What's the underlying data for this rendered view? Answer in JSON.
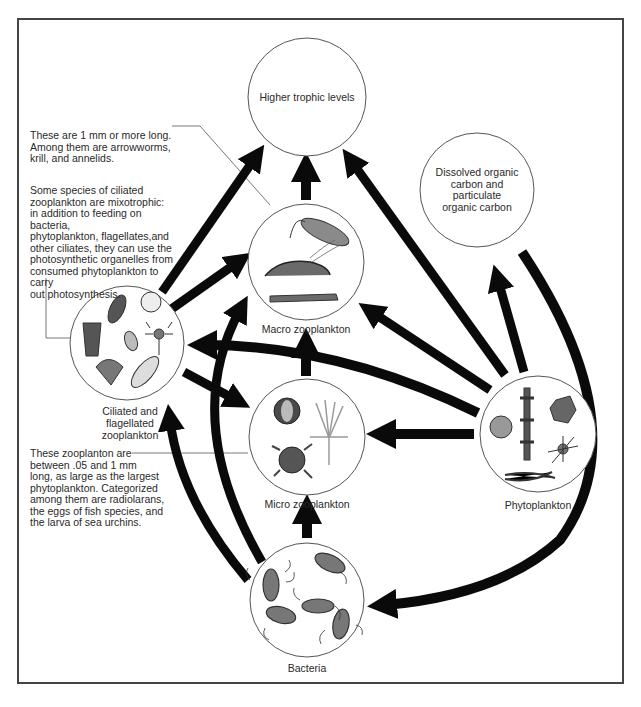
{
  "diagram": {
    "type": "food-web",
    "nodes": {
      "higher": {
        "label": "Higher trophic levels"
      },
      "macro": {
        "label": "Macro zooplankton"
      },
      "micro": {
        "label": "Micro zooplankton"
      },
      "bacteria": {
        "label": "Bacteria"
      },
      "ciliated": {
        "label_lines": [
          "Ciliated and",
          "flagellated",
          "zooplankton"
        ]
      },
      "phyto": {
        "label": "Phytoplankton"
      },
      "doc": {
        "label_lines": [
          "Dissolved organic",
          "carbon and",
          "particulate",
          "organic carbon"
        ]
      }
    },
    "notes": {
      "macro_note": [
        "These are 1 mm or more long.",
        "Among them are arrowworms,",
        "krill, and annelids."
      ],
      "ciliated_note": [
        "Some species of ciliated",
        "zooplankton are mixotrophic:",
        "in addition to feeding on bacteria,",
        "phytoplankton, flagellates,and",
        "other ciliates, they can use the",
        "photosynthetic organelles from",
        "consumed phytoplankton to carry",
        "out photosynthesis."
      ],
      "micro_note": [
        "These zooplanton are",
        "between .05 and 1 mm",
        "long, as large as the largest",
        "phytoplankton. Categorized",
        "among them are radiolarans,",
        "the eggs of fish species, and",
        "the larva of sea urchins."
      ]
    },
    "edges": [
      {
        "from": "Macro zooplankton",
        "to": "Higher trophic levels"
      },
      {
        "from": "Ciliated and flagellated zooplankton",
        "to": "Higher trophic levels"
      },
      {
        "from": "Ciliated and flagellated zooplankton",
        "to": "Macro zooplankton"
      },
      {
        "from": "Ciliated and flagellated zooplankton",
        "to": "Micro zooplankton"
      },
      {
        "from": "Micro zooplankton",
        "to": "Macro zooplankton"
      },
      {
        "from": "Bacteria",
        "to": "Micro zooplankton"
      },
      {
        "from": "Bacteria",
        "to": "Ciliated and flagellated zooplankton"
      },
      {
        "from": "Bacteria",
        "to": "Macro zooplankton"
      },
      {
        "from": "Phytoplankton",
        "to": "Higher trophic levels"
      },
      {
        "from": "Phytoplankton",
        "to": "Macro zooplankton"
      },
      {
        "from": "Phytoplankton",
        "to": "Micro zooplankton"
      },
      {
        "from": "Phytoplankton",
        "to": "Ciliated and flagellated zooplankton"
      },
      {
        "from": "Phytoplankton",
        "to": "Dissolved organic carbon and particulate organic carbon"
      },
      {
        "from": "Dissolved organic carbon and particulate organic carbon",
        "to": "Bacteria"
      }
    ],
    "colors": {
      "arrow": "#0a0a0a",
      "circle_stroke": "#555555",
      "organism_fill": "#7a7a7a",
      "frame": "#444444"
    }
  }
}
